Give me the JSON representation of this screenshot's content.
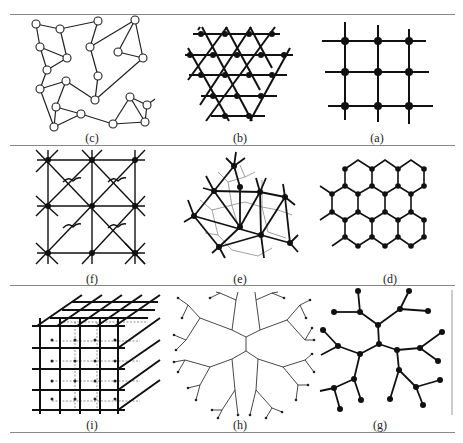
{
  "figure": {
    "panels": [
      {
        "id": "c",
        "label": "(c)",
        "description": "random mesh network with hollow nodes"
      },
      {
        "id": "b",
        "label": "(b)",
        "description": "triangular lattice"
      },
      {
        "id": "a",
        "label": "(a)",
        "description": "square lattice 3x3"
      },
      {
        "id": "f",
        "label": "(f)",
        "description": "square lattice with diagonals and curved connectors"
      },
      {
        "id": "e",
        "label": "(e)",
        "description": "irregular mesh with dual graph"
      },
      {
        "id": "d",
        "label": "(d)",
        "description": "hexagonal honeycomb lattice"
      },
      {
        "id": "i",
        "label": "(i)",
        "description": "3D cubic lattice"
      },
      {
        "id": "h",
        "label": "(h)",
        "description": "circular tree (Cayley tree)"
      },
      {
        "id": "g",
        "label": "(g)",
        "description": "branching tree network"
      }
    ]
  }
}
